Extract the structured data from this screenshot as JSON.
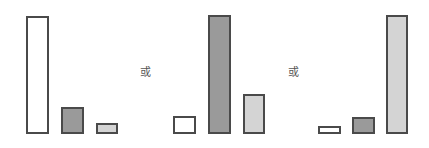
{
  "colors": {
    "white": "#ffffff",
    "dark": "#9a9a9a",
    "light": "#d4d4d4",
    "border": "#4a4a4a"
  },
  "separator_text": "或",
  "chart_data": {
    "type": "bar",
    "title": "",
    "xlabel": "",
    "ylabel": "",
    "grid": false,
    "legend": false,
    "categories": [
      "white",
      "dark gray",
      "light gray"
    ],
    "panels": [
      {
        "name": "group-1",
        "values": [
          118,
          27,
          11
        ]
      },
      {
        "name": "group-2",
        "values": [
          18,
          119,
          40
        ]
      },
      {
        "name": "group-3",
        "values": [
          8,
          17,
          119
        ]
      }
    ],
    "separators": [
      "或",
      "或"
    ]
  },
  "layout": {
    "baseline": 134,
    "bars": [
      {
        "left": 26,
        "width": 23,
        "fill": "white"
      },
      {
        "left": 61,
        "width": 23,
        "fill": "dark"
      },
      {
        "left": 96,
        "width": 22,
        "fill": "light"
      },
      {
        "left": 173,
        "width": 23,
        "fill": "white"
      },
      {
        "left": 208,
        "width": 23,
        "fill": "dark"
      },
      {
        "left": 243,
        "width": 22,
        "fill": "light"
      },
      {
        "left": 318,
        "width": 23,
        "fill": "white"
      },
      {
        "left": 352,
        "width": 23,
        "fill": "dark"
      },
      {
        "left": 386,
        "width": 22,
        "fill": "light"
      }
    ],
    "separators": [
      {
        "left": 140,
        "top": 67
      },
      {
        "left": 288,
        "top": 67
      }
    ]
  }
}
